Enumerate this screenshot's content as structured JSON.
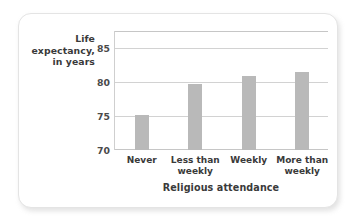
{
  "chart_data": {
    "type": "bar",
    "title": "",
    "categories": [
      "Never",
      "Less than weekly",
      "Weekly",
      "More than weekly"
    ],
    "category_lines": [
      [
        "Never"
      ],
      [
        "Less than",
        "weekly"
      ],
      [
        "Weekly"
      ],
      [
        "More than",
        "weekly"
      ]
    ],
    "values": [
      75.2,
      79.7,
      80.9,
      81.5
    ],
    "xlabel": "Religious attendance",
    "ylabel": "Life expectancy, in years",
    "ylabel_lines": [
      "Life",
      "expectancy,",
      "in years"
    ],
    "ylim": [
      70,
      87.5
    ],
    "yticks": [
      70,
      75,
      80,
      85
    ],
    "ytick_labels": [
      "70",
      "75",
      "80",
      "85"
    ],
    "grid": true,
    "legend": "none",
    "bar_color": "#b9b9b9",
    "gridline_color": "#d2d2d2",
    "axis_color": "#c6c6c6"
  }
}
